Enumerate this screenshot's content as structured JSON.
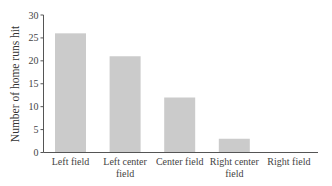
{
  "chart_data": {
    "type": "bar",
    "title": "",
    "xlabel": "",
    "ylabel": "Number of home runs hit",
    "categories": [
      [
        "Left field"
      ],
      [
        "Left center",
        "field"
      ],
      [
        "Center field"
      ],
      [
        "Right center",
        "field"
      ],
      [
        "Right field"
      ]
    ],
    "category_names": [
      "Left field",
      "Left center field",
      "Center field",
      "Right center field",
      "Right field"
    ],
    "values": [
      26,
      21,
      12,
      3,
      0
    ],
    "ylim": [
      0,
      30
    ],
    "yticks": [
      0,
      5,
      10,
      15,
      20,
      25,
      30
    ],
    "grid": false,
    "legend": null,
    "bar_color": "#cbcbcb"
  }
}
